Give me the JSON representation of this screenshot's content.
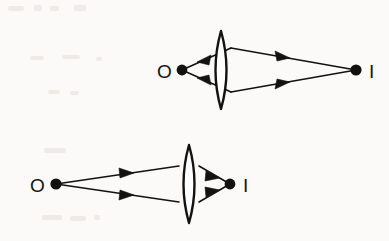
{
  "figure": {
    "background_color": "#fbfaf8",
    "ink_color": "#121212",
    "diagrams": [
      {
        "id": "top-diagram",
        "name": "near-object-far-image",
        "object_label": "O",
        "image_label": "I",
        "object_point": {
          "x": 182,
          "y": 70
        },
        "image_point": {
          "x": 356,
          "y": 70
        },
        "object_label_pos": {
          "x": 158,
          "y": 78
        },
        "image_label_pos": {
          "x": 369,
          "y": 78
        },
        "lens": {
          "cx": 221,
          "cy": 70,
          "half_width": 11,
          "half_height": 39
        },
        "ray_direction_left": "toward-object",
        "ray_direction_right": "toward-image",
        "rays": [
          {
            "name": "upper-left-ray",
            "from": {
              "x": 231,
              "y": 48
            },
            "to": {
              "x": 182,
              "y": 70
            },
            "arrow_t": 0.62
          },
          {
            "name": "lower-left-ray",
            "from": {
              "x": 231,
              "y": 92
            },
            "to": {
              "x": 182,
              "y": 70
            },
            "arrow_t": 0.62
          },
          {
            "name": "upper-right-ray",
            "from": {
              "x": 231,
              "y": 48
            },
            "to": {
              "x": 356,
              "y": 70
            },
            "arrow_t": 0.45
          },
          {
            "name": "lower-right-ray",
            "from": {
              "x": 231,
              "y": 92
            },
            "to": {
              "x": 356,
              "y": 70
            },
            "arrow_t": 0.45
          }
        ]
      },
      {
        "id": "bottom-diagram",
        "name": "far-object-near-image",
        "object_label": "O",
        "image_label": "I",
        "object_point": {
          "x": 56,
          "y": 184
        },
        "image_point": {
          "x": 230,
          "y": 184
        },
        "object_label_pos": {
          "x": 31,
          "y": 192
        },
        "image_label_pos": {
          "x": 243,
          "y": 192
        },
        "lens": {
          "cx": 189,
          "cy": 184,
          "half_width": 11,
          "half_height": 39
        },
        "ray_direction_left": "toward-lens",
        "ray_direction_right": "toward-image",
        "rays": [
          {
            "name": "upper-left-ray",
            "from": {
              "x": 56,
              "y": 184
            },
            "to": {
              "x": 179,
              "y": 166
            },
            "arrow_t": 0.56
          },
          {
            "name": "lower-left-ray",
            "from": {
              "x": 56,
              "y": 184
            },
            "to": {
              "x": 179,
              "y": 202
            },
            "arrow_t": 0.56
          },
          {
            "name": "upper-right-ray",
            "from": {
              "x": 199,
              "y": 166
            },
            "to": {
              "x": 230,
              "y": 184
            },
            "arrow_t": 0.52
          },
          {
            "name": "lower-right-ray",
            "from": {
              "x": 199,
              "y": 202
            },
            "to": {
              "x": 230,
              "y": 184
            },
            "arrow_t": 0.52
          }
        ]
      }
    ]
  }
}
